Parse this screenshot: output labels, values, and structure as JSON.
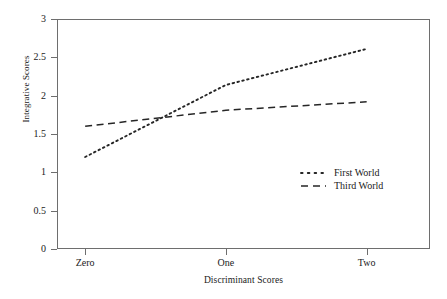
{
  "chart_data": {
    "type": "line",
    "title": "",
    "xlabel": "Discriminant Scores",
    "ylabel": "Integrative Scores",
    "categories": [
      "Zero",
      "One",
      "Two"
    ],
    "x": [
      0,
      1,
      2
    ],
    "xlim": [
      -0.2,
      2.45
    ],
    "ylim": [
      0,
      3
    ],
    "yticks": [
      0,
      0.5,
      1,
      1.5,
      2,
      2.5,
      3
    ],
    "ytick_labels": [
      "0",
      "0.5",
      "1",
      "1.5",
      "2",
      "2.5",
      "3"
    ],
    "grid": false,
    "legend_position": "center-right",
    "series": [
      {
        "name": "First World",
        "values": [
          1.2,
          2.14,
          2.61
        ],
        "linestyle": "dotted",
        "color": "#262626"
      },
      {
        "name": "Third World",
        "values": [
          1.6,
          1.81,
          1.92
        ],
        "linestyle": "dashed",
        "color": "#262626"
      }
    ]
  },
  "legend": {
    "items": [
      {
        "label": "First World",
        "marker": "dotted-line-swatch"
      },
      {
        "label": "Third World",
        "marker": "dashed-line-swatch"
      }
    ]
  },
  "colors": {
    "axis": "#6e6e6e",
    "series": "#262626",
    "background": "#ffffff",
    "text": "#1a1a1a"
  }
}
